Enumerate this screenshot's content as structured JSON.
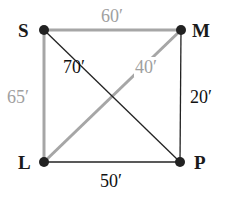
{
  "diagram": {
    "type": "weighted-graph",
    "colors": {
      "highlight_edge": "#a6a6a6",
      "normal_edge": "#222222",
      "highlight_label": "#a0a0a0",
      "normal_label": "#111111",
      "node": "#222222"
    },
    "nodes": [
      {
        "id": "S",
        "label": "S",
        "x": 44,
        "y": 30
      },
      {
        "id": "M",
        "label": "M",
        "x": 181,
        "y": 30
      },
      {
        "id": "L",
        "label": "L",
        "x": 44,
        "y": 162
      },
      {
        "id": "P",
        "label": "P",
        "x": 180,
        "y": 162
      }
    ],
    "edges": [
      {
        "from": "S",
        "to": "M",
        "weight": "60′",
        "highlighted": true
      },
      {
        "from": "S",
        "to": "L",
        "weight": "65′",
        "highlighted": true
      },
      {
        "from": "L",
        "to": "M",
        "weight": "40′",
        "highlighted": true
      },
      {
        "from": "S",
        "to": "P",
        "weight": "70′",
        "highlighted": false
      },
      {
        "from": "M",
        "to": "P",
        "weight": "20′",
        "highlighted": false
      },
      {
        "from": "L",
        "to": "P",
        "weight": "50′",
        "highlighted": false
      }
    ]
  }
}
